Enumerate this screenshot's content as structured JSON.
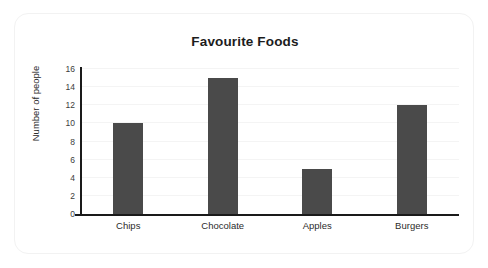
{
  "card": {
    "border_color": "#f2f2f2",
    "background": "#ffffff"
  },
  "chart_data": {
    "type": "bar",
    "title": "Favourite Foods",
    "xlabel": "",
    "ylabel": "Number of people",
    "categories": [
      "Chips",
      "Chocolate",
      "Apples",
      "Burgers"
    ],
    "values": [
      10,
      15,
      5,
      12
    ],
    "ylim": [
      0,
      16
    ],
    "yticks": [
      0,
      2,
      4,
      6,
      8,
      10,
      12,
      14,
      16
    ],
    "ytick_labels": [
      "0",
      "2",
      "4",
      "6",
      "8",
      "10",
      "12",
      "14",
      "16"
    ],
    "grid": true,
    "grid_color": "#f4f4f4",
    "legend": false,
    "bar_color": "#4a4a4a",
    "axis_color": "#1a1a1a",
    "title_color": "#1c1c1c"
  }
}
